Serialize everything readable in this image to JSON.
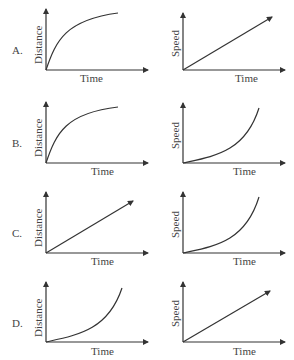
{
  "options": [
    {
      "label": "A.",
      "left": {
        "ylabel": "Distance",
        "xlabel": "Time",
        "shape": "concave-saturating"
      },
      "right": {
        "ylabel": "Speed",
        "xlabel": "Time",
        "shape": "linear"
      }
    },
    {
      "label": "B.",
      "left": {
        "ylabel": "Distance",
        "xlabel": "Time",
        "shape": "concave-saturating"
      },
      "right": {
        "ylabel": "Speed",
        "xlabel": "Time",
        "shape": "convex-increasing"
      }
    },
    {
      "label": "C.",
      "left": {
        "ylabel": "Distance",
        "xlabel": "Time",
        "shape": "linear"
      },
      "right": {
        "ylabel": "Speed",
        "xlabel": "Time",
        "shape": "convex-increasing"
      }
    },
    {
      "label": "D.",
      "left": {
        "ylabel": "Distance",
        "xlabel": "Time",
        "shape": "convex-increasing"
      },
      "right": {
        "ylabel": "Speed",
        "xlabel": "Time",
        "shape": "linear"
      }
    }
  ],
  "colors": {
    "line": "#333333",
    "text": "#444444"
  }
}
